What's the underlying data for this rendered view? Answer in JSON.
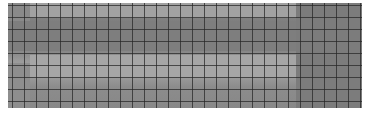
{
  "image": {
    "description": "grayscale grid texture",
    "grid_pitch_px": 12,
    "colors": {
      "background": "#ffffff",
      "grid_line": "#282828",
      "dark_tone": "#7a7a7a",
      "light_tone": "#a8a8a8"
    }
  }
}
